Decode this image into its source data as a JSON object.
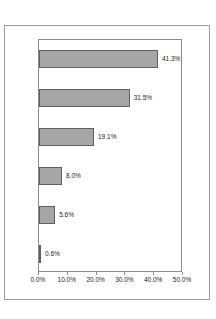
{
  "chart_data": {
    "type": "bar",
    "orientation": "horizontal",
    "title": "",
    "subtitle": "",
    "xlabel": "",
    "ylabel": "",
    "xlim": [
      0,
      50
    ],
    "grid": false,
    "legend": false,
    "legend_position": "none",
    "categories": [
      "",
      "",
      "",
      "",
      "",
      ""
    ],
    "values": [
      41.3,
      31.5,
      19.1,
      8.0,
      5.6,
      0.6
    ],
    "data_labels": [
      "41.3%",
      "31.5%",
      "19.1%",
      "8.0%",
      "5.6%",
      "0.6%"
    ],
    "xticks": [
      0,
      10,
      20,
      30,
      40,
      50
    ],
    "xtick_labels": [
      "0.0%",
      "10.0%",
      "20.0%",
      "30.0%",
      "40.0%",
      "50.0%"
    ],
    "yticks": [],
    "ytick_labels": [],
    "series": [
      {
        "name": "",
        "values": [
          41.3,
          31.5,
          19.1,
          8.0,
          5.6,
          0.6
        ]
      }
    ],
    "bar_fill_color": "#a6a6a6",
    "bar_border_color": "#5f5f5f",
    "plot_border_color": "#8c8c8c",
    "frame_border_color": "#9a9a9a",
    "background_color": "#ffffff",
    "text_color": "#1b1b1b"
  }
}
